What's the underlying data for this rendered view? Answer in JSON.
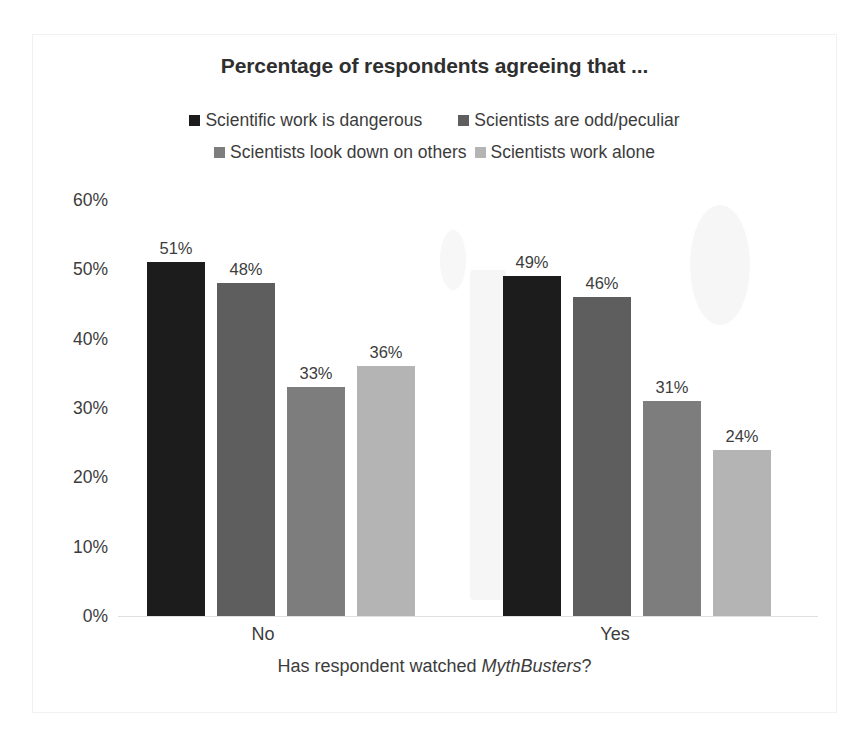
{
  "chart_data": {
    "type": "bar",
    "title": "Percentage of respondents agreeing that ...",
    "xlabel_prefix": "Has respondent watched ",
    "xlabel_emphasis": "MythBusters",
    "xlabel_suffix": "?",
    "ylabel": "",
    "ylim": [
      0,
      60
    ],
    "ytick_labels": [
      "60%",
      "50%",
      "40%",
      "30%",
      "20%",
      "10%",
      "0%"
    ],
    "ytick_values": [
      60,
      50,
      40,
      30,
      20,
      10,
      0
    ],
    "grid": false,
    "legend_position": "top",
    "categories": [
      "No",
      "Yes"
    ],
    "series": [
      {
        "name": "Scientific work is dangerous",
        "color": "#1c1c1c",
        "values": [
          51,
          49
        ],
        "labels": [
          "51%",
          "49%"
        ]
      },
      {
        "name": "Scientists are odd/peculiar",
        "color": "#5e5e5e",
        "values": [
          48,
          46
        ],
        "labels": [
          "48%",
          "46%"
        ]
      },
      {
        "name": "Scientists look down on others",
        "color": "#7d7d7d",
        "values": [
          33,
          31
        ],
        "labels": [
          "33%",
          "31%"
        ]
      },
      {
        "name": "Scientists work alone",
        "color": "#b4b4b4",
        "values": [
          36,
          24
        ],
        "labels": [
          "36%",
          "24%"
        ]
      }
    ]
  }
}
